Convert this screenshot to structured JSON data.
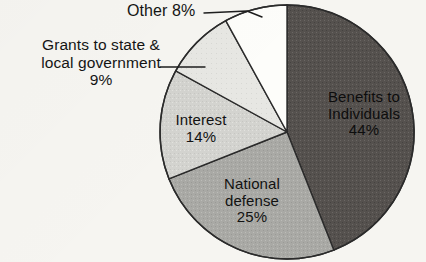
{
  "figure": {
    "background_color": "#f6f5f1",
    "ink_color": "#141414"
  },
  "callouts": {
    "other": {
      "text": "Other 8%",
      "leader": "line-to-other-slice"
    },
    "grants": {
      "line1": "Grants to state &",
      "line2": "local government",
      "line3": "9%",
      "leader": "line-to-grants-slice"
    }
  },
  "slice_labels": {
    "benefits": {
      "line1": "Benefits to",
      "line2": "Individuals",
      "line3": "44%"
    },
    "defense": {
      "line1": "National",
      "line2": "defense",
      "line3": "25%"
    },
    "interest": {
      "line1": "Interest",
      "line2": "14%"
    }
  },
  "chart_data": {
    "type": "pie",
    "title": "",
    "subtitle": "",
    "xlabel": "",
    "ylabel": "",
    "legend_position": "none",
    "grid": false,
    "units": "percent",
    "total": 100,
    "start_angle_deg": 0,
    "direction": "clockwise",
    "categories": [
      "Benefits to Individuals",
      "National defense",
      "Interest",
      "Grants to state & local government",
      "Other"
    ],
    "values": [
      44,
      25,
      14,
      9,
      8
    ],
    "value_labels": [
      "44%",
      "25%",
      "14%",
      "9%",
      "8%"
    ],
    "colors": [
      "#55514e",
      "#a9a9a5",
      "#d3d3cf",
      "#e7e7e3",
      "#fdfdfa"
    ],
    "edge_color": "#2a2a2a",
    "slices": [
      {
        "label": "Benefits to Individuals",
        "value": 44,
        "value_label": "44%",
        "color": "#55514e",
        "start_deg": 0,
        "end_deg": 158.4,
        "label_placement": "inside"
      },
      {
        "label": "National defense",
        "value": 25,
        "value_label": "25%",
        "color": "#a9a9a5",
        "start_deg": 158.4,
        "end_deg": 248.4,
        "label_placement": "inside"
      },
      {
        "label": "Interest",
        "value": 14,
        "value_label": "14%",
        "color": "#d3d3cf",
        "start_deg": 248.4,
        "end_deg": 298.8,
        "label_placement": "inside"
      },
      {
        "label": "Grants to state & local government",
        "value": 9,
        "value_label": "9%",
        "color": "#e7e7e3",
        "start_deg": 298.8,
        "end_deg": 331.2,
        "label_placement": "callout-left"
      },
      {
        "label": "Other",
        "value": 8,
        "value_label": "8%",
        "color": "#fdfdfa",
        "start_deg": 331.2,
        "end_deg": 360,
        "label_placement": "callout-top"
      }
    ],
    "geometry": {
      "center_x": 287,
      "center_y": 132,
      "radius": 127
    }
  }
}
